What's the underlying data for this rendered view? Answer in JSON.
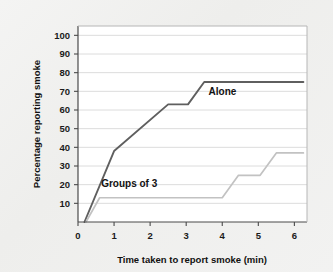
{
  "chart_data": {
    "type": "line",
    "title": "",
    "xlabel": "Time taken to report smoke (min)",
    "ylabel": "Percentage reporting smoke",
    "xlim": [
      0,
      6.35
    ],
    "ylim": [
      0,
      105
    ],
    "xticks": [
      0,
      1,
      2,
      3,
      4,
      5,
      6
    ],
    "yticks": [
      10,
      20,
      30,
      40,
      50,
      60,
      70,
      80,
      90,
      100
    ],
    "xtick_labels": [
      "0",
      "1",
      "2",
      "3",
      "4",
      "5",
      "6"
    ],
    "ytick_labels": [
      "10",
      "20",
      "30",
      "40",
      "50",
      "60",
      "70",
      "80",
      "90",
      "100"
    ],
    "grid": true,
    "grid_axis": "y",
    "legend": "inline-labels",
    "series": [
      {
        "name": "Alone",
        "color": "#5f5f5f",
        "label_x": 3.62,
        "label_y": 68,
        "points": [
          [
            0.18,
            0
          ],
          [
            1.0,
            38
          ],
          [
            2.5,
            63
          ],
          [
            3.05,
            63
          ],
          [
            3.5,
            75
          ],
          [
            6.25,
            75
          ]
        ]
      },
      {
        "name": "Groups of 3",
        "color": "#c2c2c2",
        "label_x": 1.42,
        "label_y": 19,
        "points": [
          [
            0.22,
            0
          ],
          [
            0.6,
            13
          ],
          [
            4.0,
            13
          ],
          [
            4.45,
            25
          ],
          [
            5.05,
            25
          ],
          [
            5.5,
            37
          ],
          [
            6.25,
            37
          ]
        ]
      }
    ]
  },
  "figure": {
    "background_color": "#f0f0ef",
    "plot_background_color": "#ffffff",
    "grid_color": "#d8d8d8",
    "axis_color": "#4a4a4a"
  }
}
